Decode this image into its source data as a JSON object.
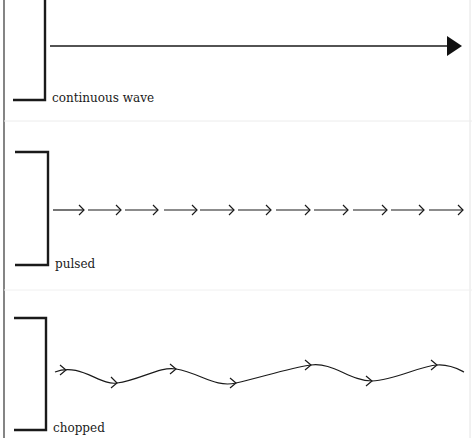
{
  "panels": [
    {
      "id": "continuous",
      "label": "continuous wave"
    },
    {
      "id": "pulsed",
      "label": "pulsed"
    },
    {
      "id": "chopped",
      "label": "chopped"
    }
  ],
  "colors": {
    "ink": "#1a1a1a",
    "divider": "#ececec",
    "background": "#ffffff"
  }
}
